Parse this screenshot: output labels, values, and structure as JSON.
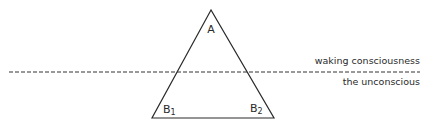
{
  "diagram": {
    "vertices": {
      "apex": "A",
      "bottom_left": "B",
      "bottom_left_sub": "1",
      "bottom_right": "B",
      "bottom_right_sub": "2"
    },
    "regions": {
      "above_line": "waking consciousness",
      "below_line": "the unconscious"
    },
    "colors": {
      "stroke": "#2a2a2a",
      "background": "#ffffff"
    }
  }
}
